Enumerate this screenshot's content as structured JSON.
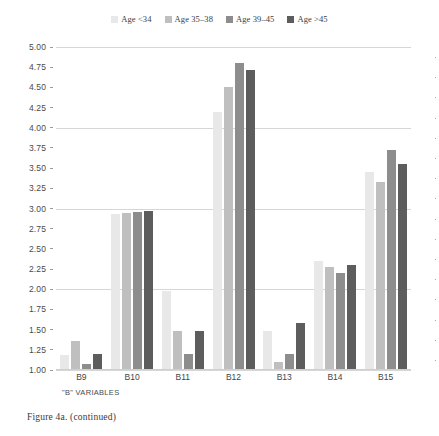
{
  "figure": {
    "caption": "Figure 4a.  (continued)"
  },
  "legend": {
    "position": "top-center",
    "entries": [
      {
        "label": "Age <34",
        "color": "#e8e8e8"
      },
      {
        "label": "Age 35–38",
        "color": "#bfbfbf"
      },
      {
        "label": "Age 39–45",
        "color": "#8d8d8d"
      },
      {
        "label": "Age >45",
        "color": "#5d5d5d"
      }
    ]
  },
  "axes": {
    "xlabel": "\"B\" VARIABLES",
    "ylabel": "",
    "yticks": [
      "5.00",
      "4.75",
      "4.50",
      "4.25",
      "4.00",
      "3.75",
      "3.50",
      "3.25",
      "3.00",
      "2.75",
      "2.50",
      "2.25",
      "2.00",
      "1.75",
      "1.50",
      "1.25",
      "1.00"
    ],
    "ymin": 1.0,
    "ymax": 5.0
  },
  "chart_data": {
    "type": "bar",
    "title": "",
    "xlabel": "\"B\" VARIABLES",
    "ylabel": "",
    "ylim": [
      1.0,
      5.0
    ],
    "ytick_step": 0.25,
    "grid": true,
    "legend_position": "top-center",
    "categories": [
      "B9",
      "B10",
      "B11",
      "B12",
      "B13",
      "B14",
      "B15"
    ],
    "series": [
      {
        "name": "Age <34",
        "color": "#e8e8e8",
        "values": [
          1.19,
          2.93,
          1.98,
          4.2,
          1.48,
          2.35,
          3.45
        ]
      },
      {
        "name": "Age 35–38",
        "color": "#bfbfbf",
        "values": [
          1.36,
          2.95,
          1.48,
          4.5,
          1.1,
          2.28,
          3.33
        ]
      },
      {
        "name": "Age 39–45",
        "color": "#8d8d8d",
        "values": [
          1.08,
          2.96,
          1.2,
          4.8,
          1.2,
          2.2,
          3.72
        ]
      },
      {
        "name": "Age >45",
        "color": "#5d5d5d",
        "values": [
          1.2,
          2.97,
          1.48,
          4.72,
          1.58,
          2.3,
          3.55
        ]
      }
    ]
  }
}
